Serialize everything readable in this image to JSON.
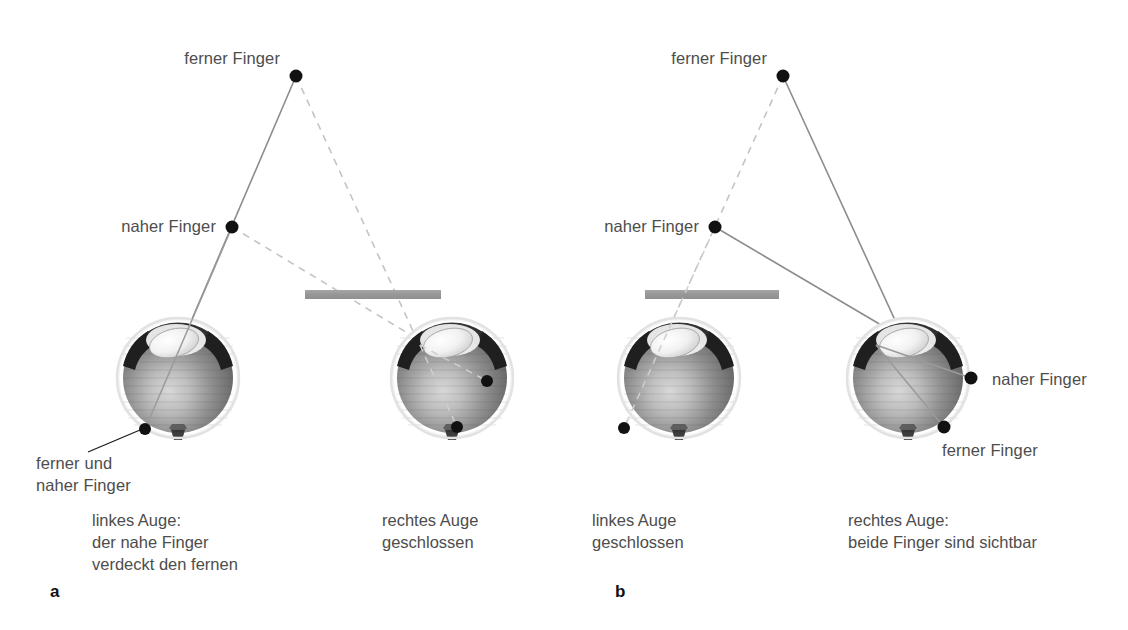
{
  "figure": {
    "background_color": "#ffffff",
    "text_color": "#4d4d4d",
    "panel_letter_color": "#111111",
    "solid_ray_color": "#8c8c8c",
    "dashed_ray_color": "#c2c2c2",
    "point_color": "#111111",
    "bar_color": "#9a9a9a",
    "leader_color": "#1c1c1c"
  },
  "panels": [
    {
      "id": "a",
      "letter": "a",
      "letter_pos": {
        "x": 50,
        "y": 597
      },
      "stimuli": [
        {
          "name": "ferner-finger",
          "label": "ferner Finger",
          "x": 296,
          "y": 76,
          "label_x": 280,
          "label_y": 64,
          "label_anchor": "end"
        },
        {
          "name": "naher-finger",
          "label": "naher Finger",
          "x": 232,
          "y": 227,
          "label_x": 216,
          "label_y": 232,
          "label_anchor": "end"
        }
      ],
      "bar": {
        "x1": 305,
        "x2": 441,
        "y": 294,
        "thickness": 9
      },
      "eyes": [
        {
          "name": "left-eye",
          "cx": 178,
          "cy": 378,
          "r": 58,
          "state": "open"
        },
        {
          "name": "right-eye",
          "cx": 452,
          "cy": 378,
          "r": 58,
          "state": "closed"
        }
      ],
      "retina_points": [
        {
          "name": "left-eye-overlapping-image",
          "x": 145,
          "y": 429
        },
        {
          "name": "right-eye-near-image",
          "x": 487,
          "y": 381
        },
        {
          "name": "right-eye-far-image",
          "x": 457,
          "y": 427
        }
      ],
      "leader_label": {
        "name": "ferner-und-naher-finger-callout",
        "lines": [
          "ferner und",
          "naher Finger"
        ],
        "x": 36,
        "y": 469,
        "leader_from": {
          "x": 140,
          "y": 430
        },
        "leader_to": {
          "x": 88,
          "y": 452
        }
      },
      "captions": [
        {
          "name": "caption-left-eye",
          "lines": [
            "linkes Auge:",
            "der nahe Finger",
            "verdeckt den fernen"
          ],
          "x": 92,
          "y": 526
        },
        {
          "name": "caption-right-eye",
          "lines": [
            "rechtes Auge",
            "geschlossen"
          ],
          "x": 382,
          "y": 526
        }
      ]
    },
    {
      "id": "b",
      "letter": "b",
      "letter_pos": {
        "x": 615,
        "y": 597
      },
      "stimuli": [
        {
          "name": "ferner-finger",
          "label": "ferner Finger",
          "x": 783,
          "y": 76,
          "label_x": 767,
          "label_y": 64,
          "label_anchor": "end"
        },
        {
          "name": "naher-finger",
          "label": "naher Finger",
          "x": 715,
          "y": 227,
          "label_x": 699,
          "label_y": 232,
          "label_anchor": "end"
        }
      ],
      "bar": {
        "x1": 645,
        "x2": 779,
        "y": 294,
        "thickness": 9
      },
      "eyes": [
        {
          "name": "left-eye",
          "cx": 679,
          "cy": 378,
          "r": 58,
          "state": "closed"
        },
        {
          "name": "right-eye",
          "cx": 908,
          "cy": 378,
          "r": 58,
          "state": "open"
        }
      ],
      "retina_points": [
        {
          "name": "left-eye-image",
          "x": 624,
          "y": 428
        },
        {
          "name": "right-eye-near-image",
          "x": 971,
          "y": 378,
          "label": "naher Finger",
          "label_x": 992,
          "label_y": 385
        },
        {
          "name": "right-eye-far-image",
          "x": 944,
          "y": 427,
          "label": "ferner Finger",
          "label_x": 942,
          "label_y": 456
        }
      ],
      "captions": [
        {
          "name": "caption-left-eye",
          "lines": [
            "linkes Auge",
            "geschlossen"
          ],
          "x": 592,
          "y": 526
        },
        {
          "name": "caption-right-eye",
          "lines": [
            "rechtes Auge:",
            "beide Finger sind sichtbar"
          ],
          "x": 848,
          "y": 526
        }
      ]
    }
  ]
}
